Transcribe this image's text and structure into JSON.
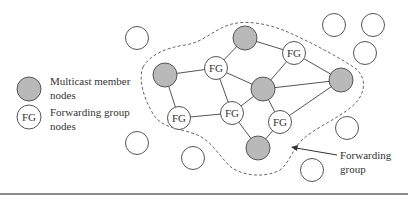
{
  "legend": {
    "member": {
      "label_line1": "Multicast member",
      "label_line2": "nodes"
    },
    "forwarding": {
      "symbol": "FG",
      "label_line1": "Forwarding group",
      "label_line2": "nodes"
    }
  },
  "annotation": {
    "line1": "Forwarding",
    "line2": "group"
  },
  "fg_label": "FG",
  "colors": {
    "member_fill": "#b9b9b9",
    "stroke": "#555555",
    "background": "#ffffff"
  },
  "nodes": {
    "member": [
      {
        "id": "m-top",
        "x": 245,
        "y": 38
      },
      {
        "id": "m-left",
        "x": 165,
        "y": 75
      },
      {
        "id": "m-center",
        "x": 263,
        "y": 89
      },
      {
        "id": "m-right",
        "x": 341,
        "y": 80
      },
      {
        "id": "m-bottom",
        "x": 258,
        "y": 148
      }
    ],
    "forwarding": [
      {
        "id": "fg-top-left",
        "x": 216,
        "y": 68
      },
      {
        "id": "fg-top-right",
        "x": 294,
        "y": 53
      },
      {
        "id": "fg-bottom-left",
        "x": 179,
        "y": 118
      },
      {
        "id": "fg-bottom-mid",
        "x": 232,
        "y": 113
      },
      {
        "id": "fg-bottom-right",
        "x": 280,
        "y": 122
      }
    ],
    "empty": [
      {
        "x": 137,
        "y": 38
      },
      {
        "x": 334,
        "y": 25
      },
      {
        "x": 373,
        "y": 25
      },
      {
        "x": 365,
        "y": 53
      },
      {
        "x": 347,
        "y": 128
      },
      {
        "x": 137,
        "y": 143
      },
      {
        "x": 193,
        "y": 158
      },
      {
        "x": 312,
        "y": 170
      }
    ]
  },
  "edges": [
    [
      "m-top",
      "fg-top-left"
    ],
    [
      "m-top",
      "fg-top-right"
    ],
    [
      "m-left",
      "fg-top-left"
    ],
    [
      "m-left",
      "fg-bottom-left"
    ],
    [
      "fg-top-left",
      "m-center"
    ],
    [
      "fg-top-left",
      "fg-bottom-mid"
    ],
    [
      "fg-top-right",
      "m-center"
    ],
    [
      "fg-top-right",
      "m-right"
    ],
    [
      "m-center",
      "m-right"
    ],
    [
      "m-center",
      "fg-bottom-mid"
    ],
    [
      "m-center",
      "fg-bottom-right"
    ],
    [
      "m-right",
      "fg-bottom-right"
    ],
    [
      "fg-bottom-left",
      "fg-bottom-mid"
    ],
    [
      "fg-bottom-mid",
      "m-bottom"
    ],
    [
      "fg-bottom-right",
      "m-bottom"
    ]
  ]
}
